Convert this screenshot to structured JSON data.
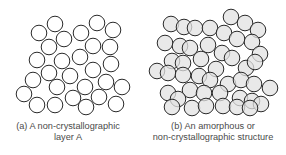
{
  "panels": [
    {
      "id": "a",
      "caption_line1": "(a)  A non-crystallographic",
      "caption_line2": "layer A",
      "circle_style": {
        "fill": "#ffffff",
        "stroke": "#2a2a2a"
      },
      "radius": 7.8,
      "circles": [
        [
          39,
          33
        ],
        [
          55,
          24
        ],
        [
          64,
          39
        ],
        [
          81,
          33
        ],
        [
          97,
          23
        ],
        [
          113,
          30
        ],
        [
          49,
          47
        ],
        [
          93,
          46
        ],
        [
          110,
          47
        ],
        [
          37,
          60
        ],
        [
          62,
          61
        ],
        [
          80,
          57
        ],
        [
          111,
          64
        ],
        [
          49,
          73
        ],
        [
          70,
          76
        ],
        [
          93,
          70
        ],
        [
          33,
          80
        ],
        [
          106,
          82
        ],
        [
          57,
          87
        ],
        [
          85,
          87
        ],
        [
          122,
          87
        ],
        [
          24,
          94
        ],
        [
          37,
          105
        ],
        [
          55,
          105
        ],
        [
          73,
          98
        ],
        [
          86,
          107
        ],
        [
          99,
          97
        ],
        [
          116,
          104
        ]
      ]
    },
    {
      "id": "b",
      "caption_line1": "(b)  An amorphous or",
      "caption_line2": "non-crystallographic structure",
      "circle_style": {
        "fill": "#e2e2e2",
        "stroke": "#2a2a2a",
        "fill_opacity": 0.75
      },
      "radius": 7.8,
      "circles": [
        [
          171,
          24
        ],
        [
          184,
          27
        ],
        [
          195,
          28
        ],
        [
          210,
          28
        ],
        [
          224,
          33
        ],
        [
          231,
          17
        ],
        [
          245,
          23
        ],
        [
          258,
          30
        ],
        [
          165,
          43
        ],
        [
          180,
          46
        ],
        [
          190,
          48
        ],
        [
          208,
          45
        ],
        [
          222,
          53
        ],
        [
          237,
          39
        ],
        [
          252,
          42
        ],
        [
          260,
          54
        ],
        [
          172,
          61
        ],
        [
          183,
          63
        ],
        [
          201,
          59
        ],
        [
          216,
          69
        ],
        [
          232,
          58
        ],
        [
          246,
          68
        ],
        [
          255,
          62
        ],
        [
          157,
          71
        ],
        [
          168,
          73
        ],
        [
          183,
          75
        ],
        [
          199,
          76
        ],
        [
          210,
          80
        ],
        [
          228,
          84
        ],
        [
          241,
          80
        ],
        [
          254,
          84
        ],
        [
          270,
          88
        ],
        [
          168,
          93
        ],
        [
          190,
          90
        ],
        [
          204,
          93
        ],
        [
          220,
          93
        ],
        [
          240,
          98
        ],
        [
          252,
          101
        ],
        [
          261,
          104
        ],
        [
          178,
          99
        ],
        [
          172,
          107
        ],
        [
          192,
          108
        ],
        [
          206,
          106
        ],
        [
          223,
          106
        ],
        [
          237,
          107
        ],
        [
          250,
          108
        ]
      ]
    }
  ]
}
